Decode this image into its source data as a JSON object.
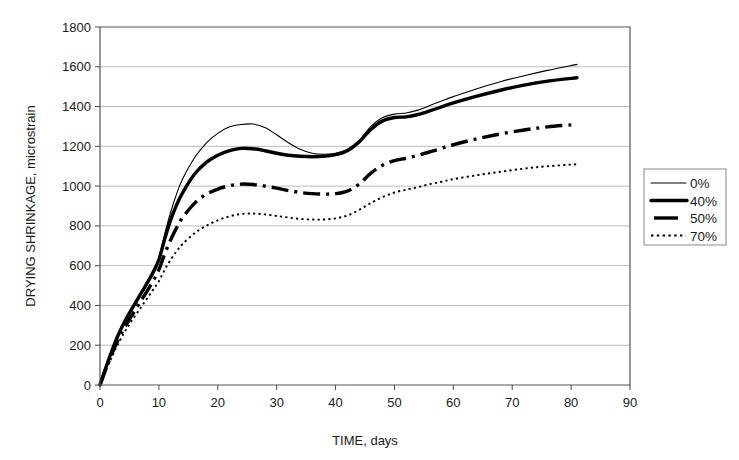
{
  "chart_data": {
    "type": "line",
    "title": "",
    "xlabel": "TIME, days",
    "ylabel": "DRYING SHRINKAGE, microstrain",
    "xlim": [
      0,
      90
    ],
    "ylim": [
      0,
      1800
    ],
    "xticks": [
      0,
      10,
      20,
      30,
      40,
      50,
      60,
      70,
      80,
      90
    ],
    "yticks": [
      0,
      200,
      400,
      600,
      800,
      1000,
      1200,
      1400,
      1600,
      1800
    ],
    "xtick_labels": [
      "0",
      "10",
      "20",
      "30",
      "40",
      "50",
      "60",
      "70",
      "80",
      "90"
    ],
    "ytick_labels": [
      "0",
      "200",
      "400",
      "600",
      "800",
      "1000",
      "1200",
      "1400",
      "1600",
      "1800"
    ],
    "grid": "horizontal",
    "legend_position": "right-outside",
    "series": [
      {
        "name": "0%",
        "style": "solid-thin",
        "x": [
          0,
          1,
          2,
          3,
          4,
          5,
          6,
          7,
          8,
          9,
          10,
          11,
          12,
          13,
          14,
          16,
          18,
          20,
          22,
          24,
          26,
          28,
          30,
          32,
          34,
          36,
          38,
          40,
          42,
          44,
          46,
          48,
          50,
          52,
          54,
          56,
          58,
          60,
          64,
          68,
          72,
          76,
          81
        ],
        "y": [
          0,
          90,
          175,
          250,
          315,
          370,
          420,
          470,
          520,
          575,
          640,
          760,
          870,
          960,
          1035,
          1140,
          1215,
          1265,
          1298,
          1310,
          1312,
          1295,
          1258,
          1218,
          1185,
          1165,
          1160,
          1165,
          1185,
          1230,
          1300,
          1345,
          1362,
          1368,
          1382,
          1405,
          1428,
          1450,
          1490,
          1525,
          1555,
          1582,
          1612
        ]
      },
      {
        "name": "40%",
        "style": "solid-thick",
        "x": [
          0,
          1,
          2,
          3,
          4,
          5,
          6,
          7,
          8,
          9,
          10,
          11,
          12,
          13,
          14,
          16,
          18,
          20,
          22,
          24,
          26,
          28,
          30,
          32,
          34,
          36,
          38,
          40,
          42,
          44,
          46,
          48,
          50,
          52,
          54,
          56,
          58,
          60,
          64,
          68,
          72,
          76,
          81
        ],
        "y": [
          0,
          88,
          170,
          245,
          308,
          362,
          412,
          462,
          512,
          565,
          630,
          735,
          830,
          905,
          965,
          1058,
          1118,
          1155,
          1178,
          1190,
          1188,
          1178,
          1165,
          1155,
          1150,
          1148,
          1150,
          1158,
          1178,
          1222,
          1285,
          1328,
          1345,
          1348,
          1360,
          1378,
          1398,
          1418,
          1452,
          1482,
          1508,
          1528,
          1545
        ]
      },
      {
        "name": "50%",
        "style": "dash-dot-thick",
        "x": [
          0,
          1,
          2,
          3,
          4,
          5,
          6,
          7,
          8,
          9,
          10,
          11,
          12,
          13,
          14,
          16,
          18,
          20,
          22,
          24,
          26,
          28,
          30,
          32,
          34,
          36,
          38,
          40,
          42,
          44,
          46,
          48,
          50,
          52,
          54,
          56,
          58,
          60,
          64,
          68,
          72,
          76,
          81
        ],
        "y": [
          0,
          80,
          155,
          222,
          280,
          330,
          378,
          425,
          472,
          522,
          580,
          660,
          730,
          790,
          840,
          912,
          958,
          985,
          1002,
          1010,
          1008,
          1000,
          990,
          978,
          968,
          962,
          960,
          962,
          975,
          1010,
          1065,
          1105,
          1128,
          1140,
          1155,
          1172,
          1190,
          1208,
          1238,
          1262,
          1282,
          1298,
          1310
        ]
      },
      {
        "name": "70%",
        "style": "dotted",
        "x": [
          0,
          1,
          2,
          3,
          4,
          5,
          6,
          7,
          8,
          9,
          10,
          11,
          12,
          13,
          14,
          16,
          18,
          20,
          22,
          24,
          26,
          28,
          30,
          32,
          34,
          36,
          38,
          40,
          42,
          44,
          46,
          48,
          50,
          52,
          54,
          56,
          58,
          60,
          64,
          68,
          72,
          76,
          81
        ],
        "y": [
          0,
          72,
          140,
          202,
          258,
          305,
          350,
          392,
          435,
          478,
          522,
          580,
          630,
          672,
          708,
          762,
          800,
          828,
          848,
          860,
          862,
          858,
          850,
          842,
          835,
          832,
          832,
          838,
          852,
          880,
          915,
          945,
          968,
          982,
          995,
          1010,
          1022,
          1035,
          1055,
          1072,
          1088,
          1100,
          1110
        ]
      }
    ],
    "legend": [
      {
        "label": "0%",
        "style": "solid-thin"
      },
      {
        "label": "40%",
        "style": "solid-thick"
      },
      {
        "label": "50%",
        "style": "dash-dot-thick"
      },
      {
        "label": "70%",
        "style": "dotted"
      }
    ],
    "colors": {
      "line": "#000000",
      "grid": "#b5b5b5",
      "axis": "#4a4a4a",
      "background": "#ffffff"
    }
  }
}
